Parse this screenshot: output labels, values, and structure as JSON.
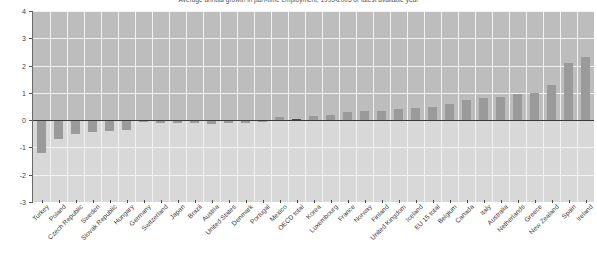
{
  "chart_data": {
    "type": "bar",
    "title": "Average annual growth in part-time employment, 1995-2005 or latest available year",
    "xlabel": "",
    "ylabel": "",
    "ylim": [
      -3,
      4
    ],
    "yticks": [
      4,
      3,
      2,
      1,
      0,
      -1,
      -2,
      -3
    ],
    "grid": true,
    "legend": "none",
    "highlight_category": "OECD total",
    "colors": {
      "bar": "#9a9a9a",
      "highlight_bar": "#4a4a4a",
      "plot_background": "#bdbdbd",
      "plot_background_lower": "#d8d8d8",
      "gridline": "#f2f2f2",
      "zeroline": "#3a3a3a",
      "axis": "#6b6b6b",
      "text": "#3a3a3a"
    },
    "categories": [
      "Turkey",
      "Poland",
      "Czech Republic",
      "Sweden",
      "Slovak Republic",
      "Hungary",
      "Germany",
      "Switzerland",
      "Japan",
      "Brazil",
      "Austria",
      "United States",
      "Denmark",
      "Portugal",
      "Mexico",
      "OECD total",
      "Korea",
      "Luxembourg",
      "France",
      "Norway",
      "Finland",
      "United Kingdom",
      "Iceland",
      "EU 15 total",
      "Belgium",
      "Canada",
      "Italy",
      "Australia",
      "Netherlands",
      "Greece",
      "New Zealand",
      "Spain",
      "Ireland"
    ],
    "values": [
      -1.2,
      -0.7,
      -0.5,
      -0.45,
      -0.4,
      -0.35,
      -0.08,
      -0.1,
      -0.12,
      -0.12,
      -0.14,
      -0.12,
      -0.1,
      -0.05,
      0.1,
      0.05,
      0.15,
      0.2,
      0.3,
      0.35,
      0.35,
      0.4,
      0.45,
      0.5,
      0.6,
      0.75,
      0.8,
      0.85,
      0.95,
      1.0,
      1.3,
      2.1,
      2.3
    ]
  }
}
